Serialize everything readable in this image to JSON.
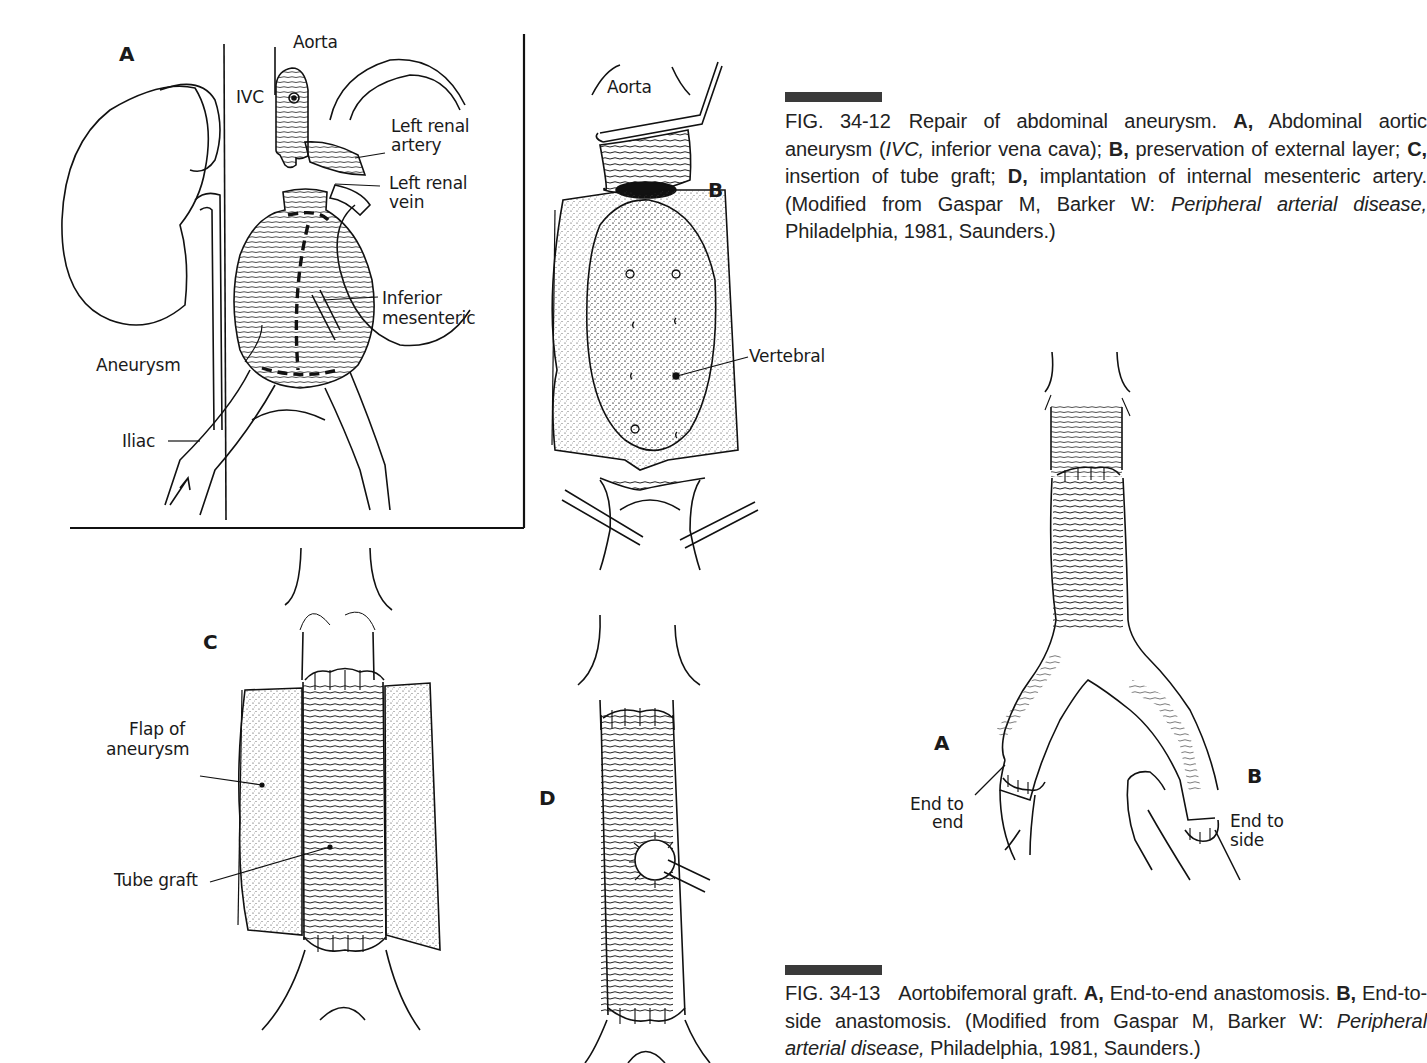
{
  "figure_34_12": {
    "panel_a": {
      "letter": "A",
      "labels": {
        "aorta": "Aorta",
        "ivc": "IVC",
        "left_renal_artery_1": "Left renal",
        "left_renal_artery_2": "artery",
        "left_renal_vein_1": "Left renal",
        "left_renal_vein_2": "vein",
        "inferior_mesenteric_1": "Inferior",
        "inferior_mesenteric_2": "mesenteric",
        "aneurysm": "Aneurysm",
        "iliac": "Iliac"
      }
    },
    "panel_b": {
      "letter": "B",
      "labels": {
        "aorta": "Aorta",
        "vertebral": "Vertebral"
      }
    },
    "panel_c": {
      "letter": "C",
      "labels": {
        "flap_1": "Flap of",
        "flap_2": "aneurysm",
        "tube_graft": "Tube graft"
      }
    },
    "panel_d": {
      "letter": "D"
    },
    "caption": {
      "fig_number": "FIG. 34-12",
      "t1": "Repair of abdominal aneurysm. ",
      "a": "A,",
      "t2": " Abdominal aortic aneurysm (",
      "ivc": "IVC,",
      "t3": " inferior vena cava); ",
      "b": "B,",
      "t4": " preservation of external layer; ",
      "c": "C,",
      "t5": " insertion of tube graft; ",
      "d": "D,",
      "t6": " implantation of internal mesenteric artery. (Modified from Gaspar M, Barker W: ",
      "book": "Peripheral arterial disease,",
      "t7": " Philadelphia, 1981, Saunders.)"
    }
  },
  "figure_34_13": {
    "labels": {
      "a": "A",
      "b": "B",
      "end_to_end_1": "End to",
      "end_to_end_2": "end",
      "end_to_side_1": "End to",
      "end_to_side_2": "side"
    },
    "caption": {
      "fig_number": "FIG. 34-13",
      "t1": "Aortobifemoral graft. ",
      "a": "A,",
      "t2": " End-to-end anastomosis. ",
      "b": "B,",
      "t3": " End-to-side anastomosis. (Modified from Gaspar M, Barker W: ",
      "book": "Peripheral arterial disease,",
      "t4": " Philadelphia, 1981, Saunders.)"
    }
  },
  "colors": {
    "ink": "#1a1a1a",
    "caption_bar": "#3a3a3a",
    "background": "#ffffff"
  }
}
